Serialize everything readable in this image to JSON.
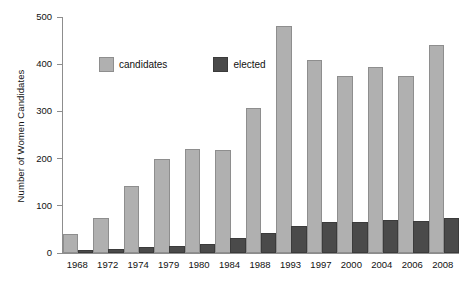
{
  "chart_data": {
    "type": "bar",
    "title": "",
    "xlabel": "",
    "ylabel": "Number of Women Candidates",
    "ylim": [
      0,
      500
    ],
    "yticks": [
      0,
      100,
      200,
      300,
      400,
      500
    ],
    "grid": false,
    "legend_position": "top-left-inside",
    "categories": [
      "1968",
      "1972",
      "1974",
      "1979",
      "1980",
      "1984",
      "1988",
      "1993",
      "1997",
      "2000",
      "2004",
      "2006",
      "2008"
    ],
    "series": [
      {
        "name": "candidates",
        "color": "#b0b0b0",
        "values": [
          36,
          71,
          137,
          196,
          217,
          213,
          302,
          476,
          405,
          371,
          390,
          370,
          437
        ]
      },
      {
        "name": "elected",
        "color": "#4a4a4a",
        "values": [
          1,
          5,
          9,
          10,
          14,
          27,
          39,
          53,
          62,
          62,
          65,
          64,
          69
        ]
      }
    ]
  },
  "legend": {
    "items": [
      {
        "label": "candidates",
        "swatch": "candidates"
      },
      {
        "label": "elected",
        "swatch": "elected"
      }
    ]
  }
}
